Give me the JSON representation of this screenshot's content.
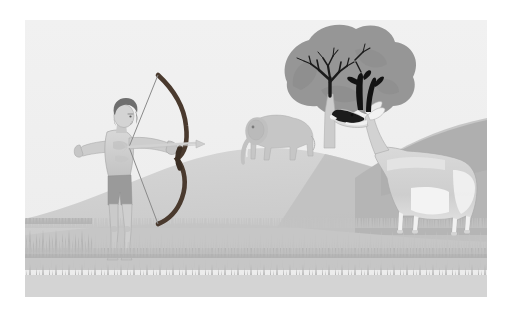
{
  "scene": {
    "title": "Archer aiming a bow at a pronghorn antelope on a grassy hill",
    "type": "illustration",
    "caption": "",
    "canvas": {
      "width": 510,
      "height": 319,
      "background": "#ffffff"
    },
    "frame": {
      "x": 25,
      "y": 20,
      "width": 462,
      "height": 277
    }
  },
  "palette": {
    "page_background": "#ffffff",
    "sky": "#eeeeee",
    "sky_top": "#f0f0f0",
    "hill_left_light": "#d3d3d3",
    "hill_main": "#cfcfcf",
    "hill_shadow": "#bdbdbd",
    "hill_right": "#b8b8b8",
    "ground_near": "#c9c9c9",
    "ground_strip": "#d8d8d8",
    "grass_dark": "#b0b0b0",
    "grass_light": "#c4c4c4",
    "skin": "#cfcfcf",
    "skin_shade": "#b9b9b9",
    "hair": "#6f6f6f",
    "shorts": "#9a9a9a",
    "bow": "#4a3a2e",
    "bowstring": "#7c7c7c",
    "arrow": "#d6d6d6",
    "tree_canopy": "#969696",
    "tree_canopy_dark": "#8a8a8a",
    "tree_branches": "#1b1b1b",
    "tree_trunk": "#cccccc",
    "elephant": "#c6c6c6",
    "elephant_shade": "#b4b4b4",
    "pronghorn_body": "#d2d2d2",
    "pronghorn_white": "#f4f4f4",
    "pronghorn_black": "#1a1a1a",
    "outline": "#9b9b9b"
  },
  "elements": [
    {
      "name": "archer",
      "label": "Archer",
      "description": "Human figure drawing a recurve bow, facing right",
      "x": 55,
      "y": 80,
      "width": 105,
      "height": 180
    },
    {
      "name": "bow",
      "label": "Bow",
      "description": "Dark brown recurve bow held vertically",
      "x": 118,
      "y": 55,
      "width": 55,
      "height": 145
    },
    {
      "name": "arrow",
      "label": "Arrow",
      "description": "Nocked arrow pointing right",
      "x": 80,
      "y": 128,
      "width": 95,
      "height": 8
    },
    {
      "name": "elephant",
      "label": "Elephant",
      "description": "Grey elephant standing on the hill crest",
      "x": 218,
      "y": 96,
      "width": 72,
      "height": 52
    },
    {
      "name": "tree",
      "label": "Tree",
      "description": "Broad canopy tree with dark forking branches",
      "x": 255,
      "y": 18,
      "width": 115,
      "height": 128
    },
    {
      "name": "pronghorn",
      "label": "Pronghorn antelope",
      "description": "Pronghorn with black horns, black cheek patch and white underbelly",
      "x": 330,
      "y": 88,
      "width": 145,
      "height": 155
    },
    {
      "name": "hill-main",
      "label": "Central hill",
      "description": "Rounded hill in the middle ground",
      "x": 130,
      "y": 130,
      "width": 300,
      "height": 110
    },
    {
      "name": "hill-right",
      "label": "Right hillside",
      "description": "Darker slope entering from the right edge",
      "x": 330,
      "y": 118,
      "width": 135,
      "height": 110
    },
    {
      "name": "grass-foreground",
      "label": "Foreground grass",
      "description": "Band of serrated grass tufts across the lower area",
      "x": 0,
      "y": 205,
      "width": 462,
      "height": 60
    },
    {
      "name": "sky",
      "label": "Sky",
      "description": "Flat very light grey sky",
      "x": 0,
      "y": 0,
      "width": 462,
      "height": 180
    }
  ]
}
